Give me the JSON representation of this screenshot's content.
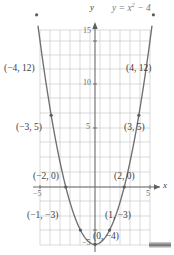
{
  "figure": {
    "title_label": "y = x",
    "equation": {
      "base": "y = x",
      "exponent": "2",
      "tail": " − 4"
    },
    "axis_labels": {
      "x": "x",
      "y": "y"
    },
    "colors": {
      "grid": "#c9c9c9",
      "axis": "#6a6a6a",
      "curve": "#6f6f6f",
      "text": "#3d3d3d",
      "tick_text": "#6d6d6d",
      "equation_text": "#7a7a7a",
      "background": "#ffffff"
    }
  },
  "chart_data": {
    "type": "line",
    "xlabel": "x",
    "ylabel": "y",
    "xlim": [
      -5.5,
      5.5
    ],
    "ylim": [
      -5.5,
      16
    ],
    "grid": true,
    "legend": "none",
    "function": "y = x^2 - 4",
    "x_ticks": [
      -5,
      5
    ],
    "x_tick_labels": [
      "−5",
      "5"
    ],
    "y_ticks": [
      -5,
      5,
      10,
      15
    ],
    "y_tick_labels": [
      "−5",
      "5",
      "10",
      "15"
    ],
    "points": [
      {
        "x": -4,
        "y": 12,
        "label": "(−4, 12)"
      },
      {
        "x": -3,
        "y": 5,
        "label": "(−3, 5)"
      },
      {
        "x": -2,
        "y": 0,
        "label": "(−2, 0)"
      },
      {
        "x": -1,
        "y": -3,
        "label": "(−1, −3)"
      },
      {
        "x": 0,
        "y": -4,
        "label": "(0, −4)"
      },
      {
        "x": 1,
        "y": -3,
        "label": "(1, −3)"
      },
      {
        "x": 2,
        "y": 0,
        "label": "(2, 0)"
      },
      {
        "x": 3,
        "y": 5,
        "label": "(3, 5)"
      },
      {
        "x": 4,
        "y": 12,
        "label": "(4, 12)"
      }
    ]
  },
  "labels": {
    "p_neg4": "(−4, 12)",
    "p_pos4": "(4, 12)",
    "p_neg3": "(−3, 5)",
    "p_pos3": "(3, 5)",
    "p_neg2": "(−2, 0)",
    "p_pos2": "(2, 0)",
    "p_neg1": "(−1, −3)",
    "p_pos1": "(1, −3)",
    "p_vertex": "(0, −4)",
    "tick_y15": "15",
    "tick_y10": "10",
    "tick_y5": "5",
    "tick_yneg5": "−5",
    "tick_xneg5": "−5",
    "tick_x5": "5",
    "axis_x": "x",
    "axis_y": "y"
  }
}
